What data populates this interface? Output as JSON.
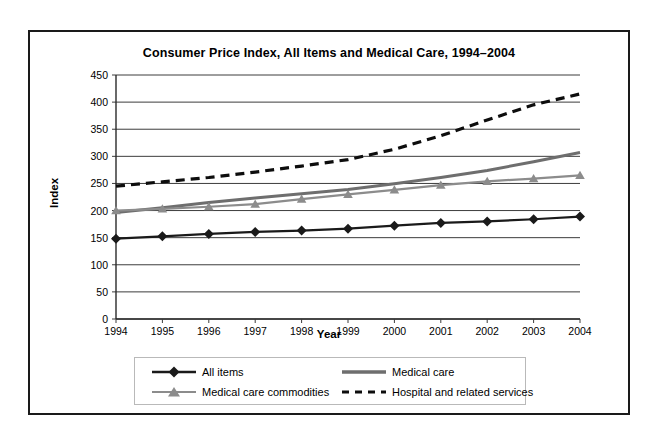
{
  "chart_data": {
    "type": "line",
    "title": "Consumer Price Index, All Items and Medical Care, 1994–2004",
    "xlabel": "Year",
    "ylabel": "Index",
    "x": [
      1994,
      1995,
      1996,
      1997,
      1998,
      1999,
      2000,
      2001,
      2002,
      2003,
      2004
    ],
    "categories": [
      "1994",
      "1995",
      "1996",
      "1997",
      "1998",
      "1999",
      "2000",
      "2001",
      "2002",
      "2003",
      "2004"
    ],
    "xlim": [
      1994,
      2004
    ],
    "ylim": [
      0,
      450
    ],
    "yticks": [
      0,
      50,
      100,
      150,
      200,
      250,
      300,
      350,
      400,
      450
    ],
    "ytick_labels": [
      "0",
      "50",
      "100",
      "150",
      "200",
      "250",
      "300",
      "350",
      "400",
      "450"
    ],
    "grid": "horizontal",
    "legend_position": "bottom",
    "series": [
      {
        "name": "All items",
        "color": "#1a1a1a",
        "style": "solid",
        "marker": "diamond",
        "values": [
          148.2,
          152.4,
          156.9,
          160.5,
          163.0,
          166.6,
          172.2,
          177.1,
          179.9,
          184.0,
          188.9
        ]
      },
      {
        "name": "Medical care",
        "color": "#6e6e6e",
        "style": "solid",
        "marker": "none",
        "values": [
          196.5,
          205.0,
          215.0,
          223.0,
          231.0,
          239.0,
          249.5,
          261.0,
          274.0,
          290.0,
          307.0
        ]
      },
      {
        "name": "Medical care commodities",
        "color": "#8c8c8c",
        "style": "solid",
        "marker": "triangle",
        "values": [
          200.0,
          203.0,
          207.0,
          212.0,
          221.0,
          230.0,
          238.0,
          247.0,
          254.0,
          259.0,
          265.0
        ]
      },
      {
        "name": "Hospital and related services",
        "color": "#0d0d0d",
        "style": "dashed",
        "marker": "none",
        "values": [
          245.0,
          253.0,
          261.0,
          271.0,
          282.0,
          294.0,
          313.0,
          338.0,
          367.0,
          395.0,
          415.0
        ]
      }
    ]
  },
  "legend": {
    "items": [
      {
        "label": "All items"
      },
      {
        "label": "Medical care"
      },
      {
        "label": "Medical care commodities"
      },
      {
        "label": "Hospital and related services"
      }
    ]
  }
}
